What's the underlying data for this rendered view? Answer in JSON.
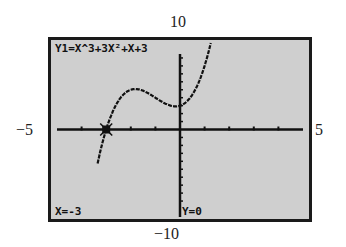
{
  "window": {
    "top_label": "10",
    "bottom_label": "−10",
    "left_label": "−5",
    "right_label": "5"
  },
  "screen": {
    "equation": "Y1=X^3+3X²+X+3",
    "x_readout": "X=-3",
    "y_readout": "Y=0"
  },
  "colors": {
    "screen_bg": "#cfcfcf",
    "ink": "#111111",
    "frame": "#1a1a1a"
  },
  "chart_data": {
    "type": "line",
    "function": "x^3+3x^2+x+3",
    "xlim": [
      -5,
      5
    ],
    "ylim": [
      -10,
      10
    ],
    "xlabel": "",
    "ylabel": "",
    "x_ticks_every": 1,
    "y_ticks_every": 1,
    "grid": false,
    "trace_point": {
      "x": -3,
      "y": 0
    },
    "series": [
      {
        "name": "Y1",
        "x": [
          -3.3,
          -3.0,
          -2.5,
          -2.0,
          -1.5,
          -1.0,
          -0.5,
          0.0,
          0.5,
          1.0,
          1.3
        ],
        "values": [
          -3.6,
          0.0,
          3.6,
          5.0,
          4.9,
          4.0,
          3.1,
          3.0,
          4.4,
          8.0,
          11.5
        ]
      }
    ]
  }
}
